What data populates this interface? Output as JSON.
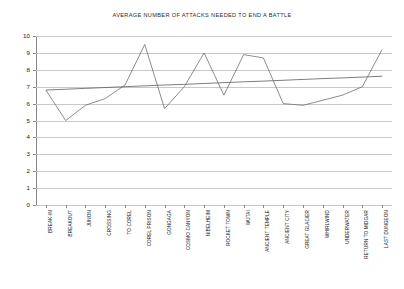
{
  "chart_data": {
    "type": "line",
    "title": "AVERAGE NUMBER OF ATTACKS NEEDED TO END A BATTLE",
    "xlabel": "",
    "ylabel": "",
    "ylim": [
      0,
      10
    ],
    "ytick_step": 1,
    "grid": true,
    "legend": "none",
    "categories": [
      "BREAK-IN",
      "BREAKOUT",
      "JUNON",
      "CROSSING",
      "TO COREL",
      "COREL PRISON",
      "GONGAGA",
      "COSMO CANYON",
      "NIBELHEIM",
      "ROCKET TOWN",
      "WUTAI",
      "ANCIENT TEMPLE",
      "ANCIENT CITY",
      "GREAT GLACIER",
      "WHIRLWIND",
      "UNDERWATER",
      "RETURN TO MIDGAR",
      "LAST DUNGEON"
    ],
    "ytick_labels": [
      "10",
      "9",
      "8",
      "7",
      "6",
      "5",
      "4",
      "3",
      "2",
      "1",
      "0"
    ],
    "series": [
      {
        "name": "Average attacks",
        "values": [
          6.8,
          5.0,
          5.9,
          6.3,
          7.1,
          9.5,
          5.7,
          7.0,
          9.0,
          6.5,
          8.9,
          8.7,
          6.0,
          5.9,
          6.2,
          6.5,
          7.0,
          9.2
        ],
        "color": "#6e6e6e"
      },
      {
        "name": "Linear trendline",
        "type": "trendline",
        "values": [
          6.8,
          6.85,
          6.9,
          6.95,
          7.0,
          7.05,
          7.1,
          7.14,
          7.19,
          7.24,
          7.29,
          7.33,
          7.38,
          7.43,
          7.48,
          7.52,
          7.57,
          7.62
        ],
        "color": "#5a5a5a"
      }
    ]
  }
}
